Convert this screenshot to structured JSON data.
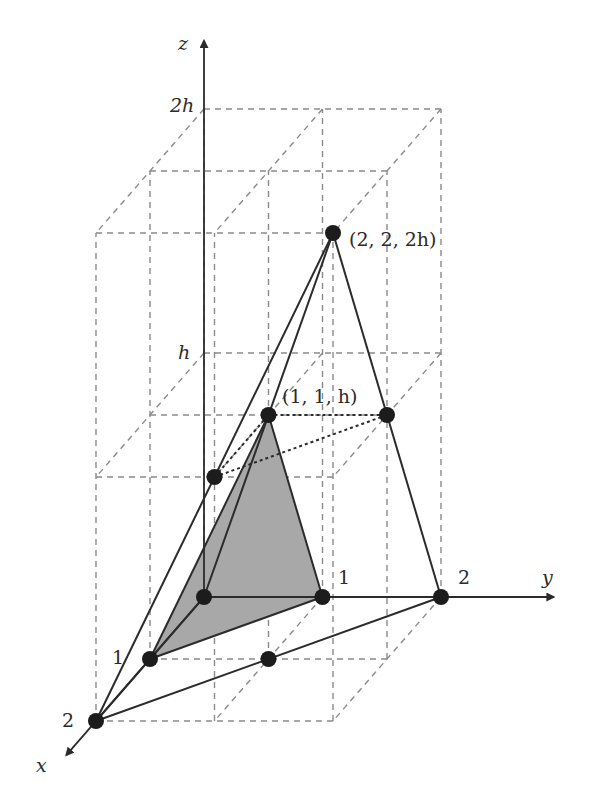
{
  "diagram": {
    "type": "3d-pyramid-coordinate-sketch",
    "projection": {
      "origin_px": [
        204,
        597
      ],
      "x_unit_px": [
        -54,
        62
      ],
      "y_unit_px": [
        118.5,
        0
      ],
      "h_unit_px": [
        0,
        -244
      ]
    },
    "axes": {
      "x": {
        "label": "x",
        "end": [
          2.55,
          0,
          0
        ],
        "label_pos": [
          36,
          772
        ]
      },
      "y": {
        "label": "y",
        "end": [
          0,
          2.95,
          0
        ],
        "label_pos": [
          542,
          584
        ]
      },
      "z": {
        "label": "z",
        "end": [
          0,
          0,
          2.28
        ],
        "label_pos": [
          178,
          50
        ]
      }
    },
    "tick_labels": [
      {
        "text": "1",
        "pos": [
          112,
          664
        ],
        "axis": "x"
      },
      {
        "text": "2",
        "pos": [
          62,
          727
        ],
        "axis": "x"
      },
      {
        "text": "1",
        "pos": [
          338,
          584
        ],
        "axis": "y"
      },
      {
        "text": "2",
        "pos": [
          458,
          584
        ],
        "axis": "y"
      },
      {
        "text": "h",
        "pos": [
          178,
          359
        ],
        "axis": "z",
        "italic": true
      },
      {
        "text": "2h",
        "pos": [
          170,
          112
        ],
        "axis": "z",
        "italic": true
      }
    ],
    "grid": {
      "x_values": [
        0,
        1,
        2
      ],
      "y_values": [
        0,
        1,
        2
      ],
      "z_values": [
        0,
        1,
        2
      ],
      "style": "dashed-gray"
    },
    "points": [
      {
        "name": "origin",
        "coord": [
          0,
          0,
          0
        ]
      },
      {
        "name": "x1",
        "coord": [
          1,
          0,
          0
        ]
      },
      {
        "name": "x2",
        "coord": [
          2,
          0,
          0
        ]
      },
      {
        "name": "y1",
        "coord": [
          0,
          1,
          0
        ]
      },
      {
        "name": "y2",
        "coord": [
          0,
          2,
          0
        ]
      },
      {
        "name": "base-mid",
        "coord": [
          1,
          1,
          0
        ]
      },
      {
        "name": "mid-top",
        "coord": [
          1,
          1,
          1
        ],
        "label": "(1, 1, h)",
        "label_pos": [
          282,
          403
        ]
      },
      {
        "name": "mid-left",
        "coord": [
          2,
          1,
          1
        ]
      },
      {
        "name": "mid-right",
        "coord": [
          1,
          2,
          1
        ]
      },
      {
        "name": "apex",
        "coord": [
          2,
          2,
          2
        ],
        "label": "(2, 2, 2h)",
        "label_pos": [
          349,
          246
        ]
      }
    ],
    "solid_edges": [
      [
        [
          2,
          2,
          2
        ],
        [
          2,
          0,
          0
        ]
      ],
      [
        [
          2,
          2,
          2
        ],
        [
          0,
          0,
          0
        ]
      ],
      [
        [
          2,
          2,
          2
        ],
        [
          0,
          2,
          0
        ]
      ],
      [
        [
          2,
          0,
          0
        ],
        [
          0,
          2,
          0
        ]
      ],
      [
        [
          2,
          0,
          0
        ],
        [
          0,
          0,
          0
        ]
      ],
      [
        [
          1,
          1,
          1
        ],
        [
          1,
          0,
          0
        ]
      ],
      [
        [
          1,
          1,
          1
        ],
        [
          0,
          1,
          0
        ]
      ],
      [
        [
          1,
          0,
          0
        ],
        [
          0,
          1,
          0
        ]
      ]
    ],
    "dotted_edges": [
      [
        [
          1,
          1,
          1
        ],
        [
          1,
          2,
          1
        ]
      ],
      [
        [
          2,
          1,
          1
        ],
        [
          1,
          1,
          1
        ]
      ],
      [
        [
          2,
          1,
          1
        ],
        [
          1,
          2,
          1
        ]
      ]
    ],
    "shaded_faces": [
      [
        [
          1,
          0,
          0
        ],
        [
          0,
          1,
          0
        ],
        [
          1,
          1,
          1
        ]
      ]
    ],
    "colors": {
      "shade": "#a8a8a8",
      "line": "#2b2b2b",
      "grid": "#8a8a8a",
      "point": "#1c1c1c"
    }
  }
}
